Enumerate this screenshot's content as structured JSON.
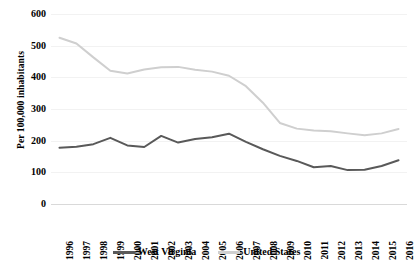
{
  "chart_data": {
    "type": "line",
    "title": "",
    "xlabel": "",
    "ylabel": "Per 100,000 inhabitants",
    "ylim": [
      0,
      600
    ],
    "ytick_values": [
      600,
      500,
      400,
      300,
      200,
      100,
      0
    ],
    "ytick_labels": [
      "600",
      "500",
      "400",
      "300",
      "200",
      "100",
      "0"
    ],
    "grid": true,
    "grid_axis": "y",
    "legend_position": "bottom",
    "categories": [
      "1996",
      "1997",
      "1998",
      "1999",
      "2000",
      "2001",
      "2002",
      "2003",
      "2004",
      "2005",
      "2006",
      "2007",
      "2008",
      "2009",
      "2010",
      "2011",
      "2012",
      "2013",
      "2014",
      "2015",
      "2016"
    ],
    "series": [
      {
        "name": "West Virginia",
        "color": "#595959",
        "values": [
          178,
          181,
          189,
          209,
          185,
          180,
          215,
          194,
          205,
          211,
          222,
          196,
          173,
          152,
          136,
          116,
          120,
          107,
          108,
          120,
          138
        ]
      },
      {
        "name": "United States",
        "color": "#cfcfcf",
        "values": [
          525,
          507,
          463,
          421,
          412,
          425,
          432,
          433,
          424,
          418,
          405,
          372,
          320,
          256,
          238,
          232,
          230,
          223,
          217,
          223,
          237
        ]
      }
    ]
  },
  "legend": {
    "items": [
      {
        "label": "West Virginia",
        "color": "#595959"
      },
      {
        "label": "United States",
        "color": "#cfcfcf"
      }
    ]
  },
  "axes": {
    "y_title": "Per 100,000 inhabitants"
  }
}
